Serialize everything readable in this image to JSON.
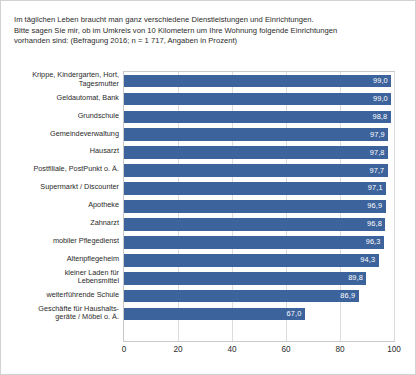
{
  "caption": {
    "lines": [
      "Im täglichen Leben braucht man ganz verschiedene Dienstleistungen und Einrichtungen.",
      "Bitte sagen Sie mir, ob im Umkreis von 10 Kilometern um Ihre Wohnung folgende Einrichtungen",
      "vorhanden sind: (Befragung 2016; n = 1 717, Angaben in Prozent)"
    ]
  },
  "chart_data": {
    "type": "bar",
    "orientation": "horizontal",
    "xlabel": "",
    "ylabel": "",
    "xlim": [
      0,
      100
    ],
    "xticks": [
      "0",
      "20",
      "40",
      "60",
      "80",
      "100"
    ],
    "grid": true,
    "legend": "none",
    "bar_color": "#3d639c",
    "value_label_color": "#ffffff",
    "decimal_separator": ",",
    "categories": [
      [
        "Krippe, Kindergarten, Hort,",
        "Tagesmutter"
      ],
      [
        "Geldautomat, Bank"
      ],
      [
        "Grundschule"
      ],
      [
        "Gemeindeverwaltung"
      ],
      [
        "Hausarzt"
      ],
      [
        "Postfiliale, PostPunkt o. Ä."
      ],
      [
        "Supermarkt / Discounter"
      ],
      [
        "Apotheke"
      ],
      [
        "Zahnarzt"
      ],
      [
        "mobiler Pflegedienst"
      ],
      [
        "Altenpflegeheim"
      ],
      [
        "kleiner Laden für",
        "Lebensmittel"
      ],
      [
        "weiterführende Schule"
      ],
      [
        "Geschäfte für Haushalts-",
        "geräte / Möbel o. Ä."
      ]
    ],
    "values": [
      99.0,
      99.0,
      98.8,
      97.9,
      97.8,
      97.7,
      97.1,
      96.9,
      96.8,
      96.3,
      94.3,
      89.8,
      86.9,
      67.0
    ],
    "value_labels": [
      "99,0",
      "99,0",
      "98,8",
      "97,9",
      "97,8",
      "97,7",
      "97,1",
      "96,9",
      "96,8",
      "96,3",
      "94,3",
      "89,8",
      "86,9",
      "67,0"
    ]
  }
}
